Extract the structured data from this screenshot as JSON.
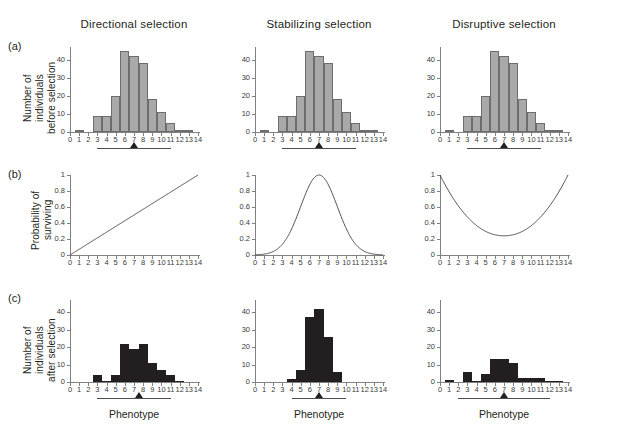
{
  "figure": {
    "columns": [
      {
        "id": "directional",
        "title": "Directional selection"
      },
      {
        "id": "stabilizing",
        "title": "Stabilizing selection"
      },
      {
        "id": "disruptive",
        "title": "Disruptive selection"
      }
    ],
    "rows": [
      {
        "id": "a",
        "letter": "(a)",
        "ylabel": "Number of\nindividuals\nbefore selection"
      },
      {
        "id": "b",
        "letter": "(b)",
        "ylabel": "Probability of\nsurviving"
      },
      {
        "id": "c",
        "letter": "(c)",
        "ylabel": "Number of\nindividuals\nafter selection"
      }
    ],
    "xlabel": "Phenotype",
    "colors": {
      "bar_before_fill": "#a9a9a9",
      "bar_before_stroke": "#6d6d6d",
      "bar_after_fill": "#231f20",
      "axis": "#808080",
      "curve": "#3a3a3a",
      "text": "#231f20"
    }
  },
  "chart_data": [
    {
      "type": "bar",
      "panel": "a1",
      "title": "Directional selection",
      "row_label": "Number of individuals before selection",
      "xlabel": "Phenotype",
      "ylabel": "Number of individuals before selection",
      "categories": [
        0,
        1,
        2,
        3,
        4,
        5,
        6,
        7,
        8,
        9,
        10,
        11,
        12,
        13,
        14
      ],
      "values": [
        0,
        1,
        0,
        9,
        9,
        20,
        45,
        42,
        38,
        18,
        11,
        5,
        1,
        1,
        0
      ],
      "xlim": [
        0,
        14
      ],
      "ylim": [
        0,
        47
      ],
      "yticks": [
        0,
        10,
        20,
        30,
        40
      ],
      "xticks": [
        0,
        1,
        2,
        3,
        4,
        5,
        6,
        7,
        8,
        9,
        10,
        11,
        12,
        13,
        14
      ],
      "grid": false,
      "marker_arrow_x": 7,
      "bracket_range": [
        3,
        11
      ]
    },
    {
      "type": "bar",
      "panel": "a2",
      "title": "Stabilizing selection",
      "row_label": "Number of individuals before selection",
      "xlabel": "Phenotype",
      "ylabel": "Number of individuals before selection",
      "categories": [
        0,
        1,
        2,
        3,
        4,
        5,
        6,
        7,
        8,
        9,
        10,
        11,
        12,
        13,
        14
      ],
      "values": [
        0,
        1,
        0,
        9,
        9,
        20,
        45,
        42,
        38,
        18,
        11,
        5,
        1,
        1,
        0
      ],
      "xlim": [
        0,
        14
      ],
      "ylim": [
        0,
        47
      ],
      "yticks": [
        0,
        10,
        20,
        30,
        40
      ],
      "xticks": [
        0,
        1,
        2,
        3,
        4,
        5,
        6,
        7,
        8,
        9,
        10,
        11,
        12,
        13,
        14
      ],
      "grid": false,
      "marker_arrow_x": 7,
      "bracket_range": [
        3,
        11
      ]
    },
    {
      "type": "bar",
      "panel": "a3",
      "title": "Disruptive selection",
      "row_label": "Number of individuals before selection",
      "xlabel": "Phenotype",
      "ylabel": "Number of individuals before selection",
      "categories": [
        0,
        1,
        2,
        3,
        4,
        5,
        6,
        7,
        8,
        9,
        10,
        11,
        12,
        13,
        14
      ],
      "values": [
        0,
        1,
        0,
        9,
        9,
        20,
        45,
        42,
        38,
        18,
        11,
        5,
        1,
        1,
        0
      ],
      "xlim": [
        0,
        14
      ],
      "ylim": [
        0,
        47
      ],
      "yticks": [
        0,
        10,
        20,
        30,
        40
      ],
      "xticks": [
        0,
        1,
        2,
        3,
        4,
        5,
        6,
        7,
        8,
        9,
        10,
        11,
        12,
        13,
        14
      ],
      "grid": false,
      "marker_arrow_x": 7,
      "bracket_range": [
        3,
        11
      ]
    },
    {
      "type": "line",
      "panel": "b1",
      "title": "Directional selection",
      "row_label": "Probability of surviving",
      "xlabel": "Phenotype",
      "ylabel": "Probability of surviving",
      "shape": "linear-increasing",
      "x": [
        0,
        1,
        2,
        3,
        4,
        5,
        6,
        7,
        8,
        9,
        10,
        11,
        12,
        13,
        14
      ],
      "y": [
        0.0,
        0.071,
        0.143,
        0.214,
        0.286,
        0.357,
        0.429,
        0.5,
        0.571,
        0.643,
        0.714,
        0.786,
        0.857,
        0.929,
        1.0
      ],
      "xlim": [
        0,
        14
      ],
      "ylim": [
        0,
        1
      ],
      "yticks": [
        0,
        0.2,
        0.4,
        0.6,
        0.8,
        1
      ],
      "yticklabels": [
        "0",
        "0.2",
        "0.4",
        "0.6",
        "0.8",
        "1"
      ],
      "xticks": [
        0,
        1,
        2,
        3,
        4,
        5,
        6,
        7,
        8,
        9,
        10,
        11,
        12,
        13,
        14
      ],
      "grid": false
    },
    {
      "type": "line",
      "panel": "b2",
      "title": "Stabilizing selection",
      "row_label": "Probability of surviving",
      "xlabel": "Phenotype",
      "ylabel": "Probability of surviving",
      "shape": "gaussian-peak",
      "x": [
        0,
        1,
        2,
        3,
        4,
        5,
        6,
        7,
        8,
        9,
        10,
        11,
        12,
        13,
        14
      ],
      "y": [
        0.002,
        0.008,
        0.03,
        0.097,
        0.264,
        0.607,
        0.895,
        1.0,
        0.895,
        0.607,
        0.264,
        0.097,
        0.03,
        0.008,
        0.002
      ],
      "xlim": [
        0,
        14
      ],
      "ylim": [
        0,
        1
      ],
      "yticks": [
        0,
        0.2,
        0.4,
        0.6,
        0.8,
        1
      ],
      "yticklabels": [
        "0",
        "0.2",
        "0.4",
        "0.6",
        "0.8",
        "1"
      ],
      "xticks": [
        0,
        1,
        2,
        3,
        4,
        5,
        6,
        7,
        8,
        9,
        10,
        11,
        12,
        13,
        14
      ],
      "grid": false
    },
    {
      "type": "line",
      "panel": "b3",
      "title": "Disruptive selection",
      "row_label": "Probability of surviving",
      "xlabel": "Phenotype",
      "ylabel": "Probability of surviving",
      "shape": "u-shaped",
      "x": [
        0,
        1,
        2,
        3,
        4,
        5,
        6,
        7,
        8,
        9,
        10,
        11,
        12,
        13,
        14
      ],
      "y": [
        1.0,
        0.77,
        0.58,
        0.44,
        0.34,
        0.28,
        0.25,
        0.24,
        0.25,
        0.28,
        0.34,
        0.44,
        0.58,
        0.77,
        1.0
      ],
      "xlim": [
        0,
        14
      ],
      "ylim": [
        0,
        1
      ],
      "yticks": [
        0,
        0.2,
        0.4,
        0.6,
        0.8,
        1
      ],
      "yticklabels": [
        "0",
        "0.2",
        "0.4",
        "0.6",
        "0.8",
        "1"
      ],
      "xticks": [
        0,
        1,
        2,
        3,
        4,
        5,
        6,
        7,
        8,
        9,
        10,
        11,
        12,
        13,
        14
      ],
      "grid": false
    },
    {
      "type": "bar",
      "panel": "c1",
      "title": "Directional selection",
      "row_label": "Number of individuals after selection",
      "xlabel": "Phenotype",
      "ylabel": "Number of individuals after selection",
      "categories": [
        0,
        1,
        2,
        3,
        4,
        5,
        6,
        7,
        8,
        9,
        10,
        11,
        12,
        13,
        14
      ],
      "values": [
        0,
        0,
        0,
        4,
        0.5,
        4,
        22,
        19,
        22,
        11,
        7,
        4,
        0.5,
        0,
        0
      ],
      "xlim": [
        0,
        14
      ],
      "ylim": [
        0,
        47
      ],
      "yticks": [
        0,
        10,
        20,
        30,
        40
      ],
      "xticks": [
        0,
        1,
        2,
        3,
        4,
        5,
        6,
        7,
        8,
        9,
        10,
        11,
        12,
        13,
        14
      ],
      "grid": false,
      "marker_arrow_x": 7.6,
      "bracket_range": [
        3,
        11
      ]
    },
    {
      "type": "bar",
      "panel": "c2",
      "title": "Stabilizing selection",
      "row_label": "Number of individuals after selection",
      "xlabel": "Phenotype",
      "ylabel": "Number of individuals after selection",
      "categories": [
        0,
        1,
        2,
        3,
        4,
        5,
        6,
        7,
        8,
        9,
        10,
        11,
        12,
        13,
        14
      ],
      "values": [
        0,
        0,
        0,
        0,
        2,
        7,
        37,
        42,
        26,
        6,
        0,
        0,
        0,
        0,
        0
      ],
      "xlim": [
        0,
        14
      ],
      "ylim": [
        0,
        47
      ],
      "yticks": [
        0,
        10,
        20,
        30,
        40
      ],
      "xticks": [
        0,
        1,
        2,
        3,
        4,
        5,
        6,
        7,
        8,
        9,
        10,
        11,
        12,
        13,
        14
      ],
      "grid": false,
      "marker_arrow_x": 7,
      "bracket_range": [
        4,
        10
      ]
    },
    {
      "type": "bar",
      "panel": "c3",
      "title": "Disruptive selection",
      "row_label": "Number of individuals after selection",
      "xlabel": "Phenotype",
      "ylabel": "Number of individuals after selection",
      "categories": [
        0,
        1,
        2,
        3,
        4,
        5,
        6,
        7,
        8,
        9,
        10,
        11,
        12,
        13,
        14
      ],
      "values": [
        0,
        1,
        0,
        6,
        0.5,
        4.5,
        13,
        13,
        11,
        2.5,
        2.5,
        2.5,
        0.5,
        0.5,
        0
      ],
      "xlim": [
        0,
        14
      ],
      "ylim": [
        0,
        47
      ],
      "yticks": [
        0,
        10,
        20,
        30,
        40
      ],
      "xticks": [
        0,
        1,
        2,
        3,
        4,
        5,
        6,
        7,
        8,
        9,
        10,
        11,
        12,
        13,
        14
      ],
      "grid": false,
      "marker_arrow_x": 7,
      "bracket_range": [
        2,
        12
      ]
    }
  ]
}
